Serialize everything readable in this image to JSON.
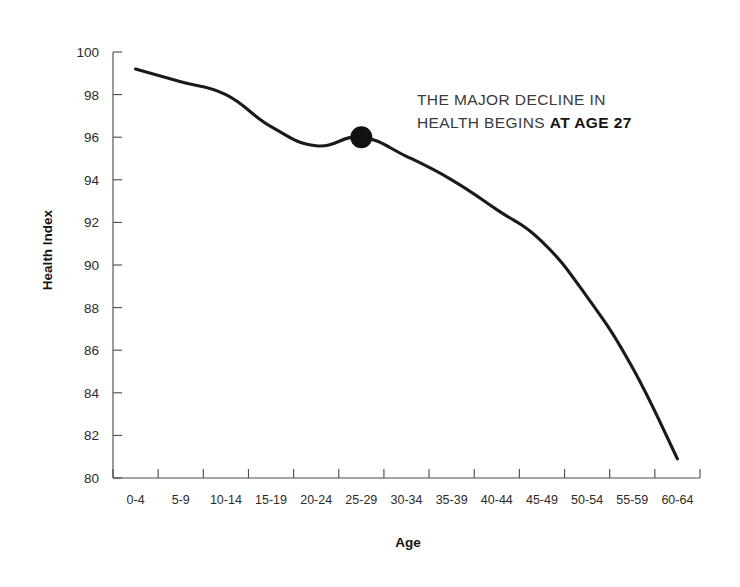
{
  "chart_data": {
    "type": "line",
    "title": "",
    "subtitle": "",
    "xlabel": "Age",
    "ylabel": "Health Index",
    "categories": [
      "0-4",
      "5-9",
      "10-14",
      "15-19",
      "20-24",
      "25-29",
      "30-34",
      "35-39",
      "40-44",
      "45-49",
      "50-54",
      "55-59",
      "60-64"
    ],
    "values": [
      99.2,
      98.6,
      98.0,
      96.5,
      95.6,
      96.0,
      95.1,
      94.0,
      92.6,
      91.1,
      88.5,
      85.2,
      80.9
    ],
    "series": [
      {
        "name": "Health Index",
        "values": [
          99.2,
          98.6,
          98.0,
          96.5,
          95.6,
          96.0,
          95.1,
          94.0,
          92.6,
          91.1,
          88.5,
          85.2,
          80.9
        ]
      }
    ],
    "ylim": [
      80,
      100
    ],
    "ytick_labels": [
      "80",
      "82",
      "84",
      "86",
      "88",
      "90",
      "92",
      "94",
      "96",
      "98",
      "100"
    ],
    "yticks": [
      80,
      82,
      84,
      86,
      88,
      90,
      92,
      94,
      96,
      98,
      100
    ],
    "grid": false,
    "legend": false,
    "legend_position": "none",
    "line_color": "#1a1a1a",
    "marker": {
      "category": "25-29",
      "value": 96.0,
      "color": "#111111",
      "label": "age-27-marker"
    },
    "annotations": [
      {
        "id": "major-decline-note",
        "line1": "THE MAJOR DECLINE IN",
        "line2_normal": "HEALTH BEGINS ",
        "line2_bold": "AT AGE 27"
      }
    ]
  },
  "axes": {
    "y_title": "Health Index",
    "x_title": "Age"
  },
  "colors": {
    "line": "#1a1a1a",
    "axis": "#4a4a4a",
    "text": "#2b2b2b",
    "accent": "#111111",
    "background": "#ffffff"
  }
}
